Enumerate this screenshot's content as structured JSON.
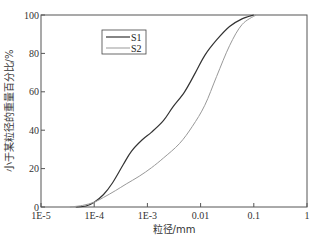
{
  "chart_data": {
    "type": "line",
    "title": "",
    "xlabel": "粒径/mm",
    "ylabel": "小于某粒径的重量百分比/%",
    "xscale": "log",
    "xlim": [
      1e-05,
      1
    ],
    "ylim": [
      0,
      100
    ],
    "xticks": [
      1e-05,
      0.0001,
      0.001,
      0.01,
      0.1,
      1
    ],
    "xtick_labels": [
      "1E-5",
      "1E-4",
      "1E-3",
      "0.01",
      "0.1",
      "1"
    ],
    "yticks": [
      0,
      20,
      40,
      60,
      80,
      100
    ],
    "ytick_labels": [
      "0",
      "20",
      "40",
      "60",
      "80",
      "100"
    ],
    "grid": false,
    "legend_position": "top-left",
    "series": [
      {
        "name": "S1",
        "color": "#333333",
        "x": [
          4.5e-05,
          7e-05,
          0.0001,
          0.00015,
          0.00022,
          0.00035,
          0.0005,
          0.0008,
          0.0012,
          0.002,
          0.003,
          0.005,
          0.008,
          0.012,
          0.02,
          0.035,
          0.06,
          0.1
        ],
        "y": [
          0,
          0.5,
          2.5,
          6.5,
          12.5,
          22,
          29,
          35,
          39,
          45,
          52,
          60,
          70,
          79,
          87,
          94,
          98,
          100
        ]
      },
      {
        "name": "S2",
        "color": "#999999",
        "x": [
          3.5e-05,
          6e-05,
          0.0001,
          0.00015,
          0.00025,
          0.0004,
          0.0007,
          0.0012,
          0.002,
          0.004,
          0.007,
          0.012,
          0.02,
          0.035,
          0.06,
          0.11
        ],
        "y": [
          0,
          0.8,
          2.5,
          5,
          8.5,
          12,
          16,
          20.5,
          25.5,
          33,
          42,
          53,
          68,
          84,
          95,
          100
        ]
      }
    ]
  }
}
